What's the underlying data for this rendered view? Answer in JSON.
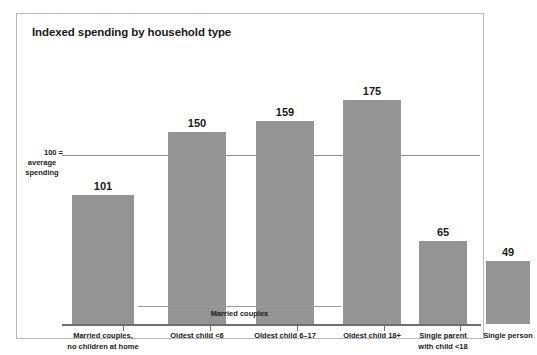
{
  "figure": {
    "title": "Indexed spending by household type",
    "axis_note_line1": "100 =",
    "axis_note_line2": "average",
    "axis_note_line3": "spending",
    "group_bracket_label": "Married couples",
    "bar_color": "#949494",
    "frame_color": "#b9b9b9",
    "baseline_color": "#6e6e6e",
    "refline_color": "#8d8d8d",
    "text_color": "#1a1a1a",
    "background": "#ffffff"
  },
  "chart_data": {
    "type": "bar",
    "title": "Indexed spending by household type",
    "xlabel": "",
    "ylabel": "",
    "ylim": [
      0,
      200
    ],
    "grid": false,
    "legend": null,
    "reference_line": {
      "value": 100,
      "label": "100 = average spending"
    },
    "group_bracket": {
      "label": "Married couples",
      "spans_categories": [
        "Oldest child <6",
        "Oldest child 6–17",
        "Oldest child 18+"
      ]
    },
    "categories": [
      "Married couples,\nno children at home",
      "Oldest child <6",
      "Oldest child 6–17",
      "Oldest child 18+",
      "Single parent\nwith child <18",
      "Single person"
    ],
    "values": [
      101,
      150,
      159,
      175,
      65,
      49
    ],
    "data_labels": [
      "101",
      "150",
      "159",
      "175",
      "65",
      "49"
    ]
  },
  "bars": [
    {
      "label": "Married couples,\nno children at home",
      "value": "101",
      "left": 10,
      "width": 62,
      "height": 129
    },
    {
      "label": "Oldest child <6",
      "value": "150",
      "left": 106,
      "width": 58,
      "height": 192
    },
    {
      "label": "Oldest child 6–17",
      "value": "159",
      "left": 194,
      "width": 58,
      "height": 203
    },
    {
      "label": "Oldest child 18+",
      "value": "175",
      "left": 281,
      "width": 58,
      "height": 224
    },
    {
      "label": "Single parent\nwith child <18",
      "value": "65",
      "left": 357,
      "width": 48,
      "height": 83
    },
    {
      "label": "Single person",
      "value": "49",
      "left": 424,
      "width": 44,
      "height": 63
    }
  ],
  "ticks": [
    61,
    148,
    235,
    322,
    398
  ]
}
